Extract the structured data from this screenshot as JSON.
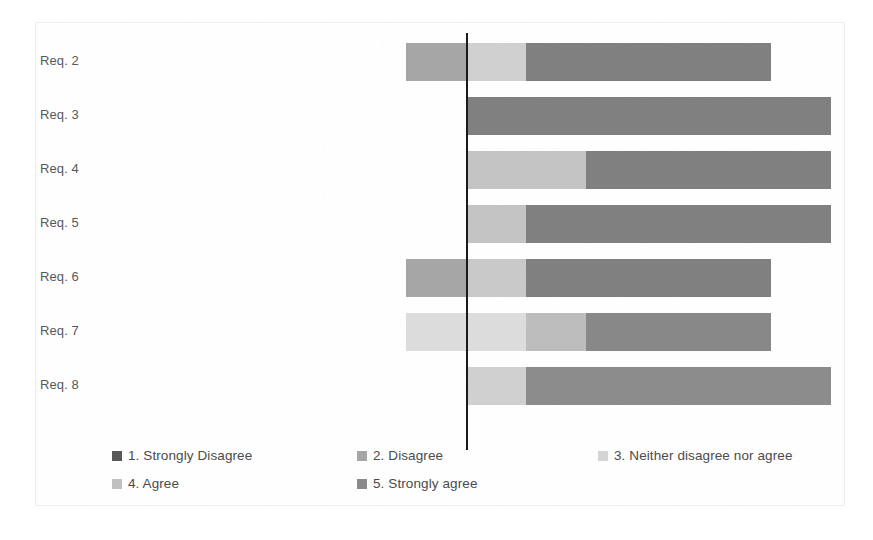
{
  "chart_data": {
    "type": "bar",
    "subtype": "diverging-stacked-likert",
    "title": "",
    "xlabel": "",
    "ylabel": "",
    "grid": false,
    "legend_position": "bottom",
    "axis_zero_label": "",
    "categories": [
      "Req. 2",
      "Req. 3",
      "Req. 4",
      "Req. 5",
      "Req. 6",
      "Req. 7",
      "Req. 8"
    ],
    "series": [
      {
        "name": "1. Strongly Disagree",
        "color": "#595959",
        "values": [
          0,
          0,
          0,
          0,
          0,
          0,
          0
        ]
      },
      {
        "name": "2. Disagree",
        "color": "#a6a6a6",
        "values": [
          10,
          0,
          0,
          0,
          10,
          0,
          0
        ]
      },
      {
        "name": "3. Neither disagree nor agree",
        "color": "#d9d9d9",
        "values": [
          10,
          0,
          20,
          10,
          10,
          20,
          10
        ]
      },
      {
        "name": "4. Agree",
        "color": "#bfbfbf",
        "values": [
          0,
          0,
          0,
          0,
          0,
          10,
          0
        ]
      },
      {
        "name": "5. Strongly agree",
        "color": "#808080",
        "values": [
          40,
          60,
          40,
          50,
          40,
          30,
          50
        ]
      }
    ],
    "bars": [
      {
        "category": "Req. 2",
        "segments": [
          {
            "series": "2. Disagree",
            "x0": 406,
            "x1": 466,
            "color": "#a6a6a6"
          },
          {
            "series": "3. Neither disagree nor agree",
            "x0": 466,
            "x1": 526,
            "color": "#d0d0d0"
          },
          {
            "series": "5. Strongly agree",
            "x0": 526,
            "x1": 771,
            "color": "#808080"
          }
        ]
      },
      {
        "category": "Req. 3",
        "segments": [
          {
            "series": "5. Strongly agree",
            "x0": 466,
            "x1": 831,
            "color": "#808080"
          }
        ]
      },
      {
        "category": "Req. 4",
        "segments": [
          {
            "series": "3. Neither disagree nor agree",
            "x0": 466,
            "x1": 586,
            "color": "#c4c4c4"
          },
          {
            "series": "5. Strongly agree",
            "x0": 586,
            "x1": 831,
            "color": "#808080"
          }
        ]
      },
      {
        "category": "Req. 5",
        "segments": [
          {
            "series": "3. Neither disagree nor agree",
            "x0": 466,
            "x1": 526,
            "color": "#c4c4c4"
          },
          {
            "series": "5. Strongly agree",
            "x0": 526,
            "x1": 831,
            "color": "#808080"
          }
        ]
      },
      {
        "category": "Req. 6",
        "segments": [
          {
            "series": "2. Disagree",
            "x0": 406,
            "x1": 466,
            "color": "#a6a6a6"
          },
          {
            "series": "3. Neither disagree nor agree",
            "x0": 466,
            "x1": 526,
            "color": "#c9c9c9"
          },
          {
            "series": "5. Strongly agree",
            "x0": 526,
            "x1": 771,
            "color": "#808080"
          }
        ]
      },
      {
        "category": "Req. 7",
        "segments": [
          {
            "series": "3. Neither disagree nor agree",
            "x0": 406,
            "x1": 526,
            "color": "#dcdcdc"
          },
          {
            "series": "4. Agree",
            "x0": 526,
            "x1": 586,
            "color": "#bdbdbd"
          },
          {
            "series": "5. Strongly agree",
            "x0": 586,
            "x1": 771,
            "color": "#888888"
          }
        ]
      },
      {
        "category": "Req. 8",
        "segments": [
          {
            "series": "3. Neither disagree nor agree",
            "x0": 466,
            "x1": 526,
            "color": "#d0d0d0"
          },
          {
            "series": "5. Strongly agree",
            "x0": 526,
            "x1": 831,
            "color": "#8c8c8c"
          }
        ]
      }
    ]
  },
  "legend": {
    "items": [
      {
        "label": "1. Strongly Disagree",
        "color": "#595959",
        "left": 112,
        "top": 0
      },
      {
        "label": "2. Disagree",
        "color": "#a6a6a6",
        "left": 357,
        "top": 0
      },
      {
        "label": "3. Neither disagree nor agree",
        "color": "#d4d4d4",
        "left": 598,
        "top": 0
      },
      {
        "label": "4. Agree",
        "color": "#c0c0c0",
        "left": 112,
        "top": 28
      },
      {
        "label": "5. Strongly agree",
        "color": "#8a8a8a",
        "left": 357,
        "top": 28
      }
    ]
  }
}
